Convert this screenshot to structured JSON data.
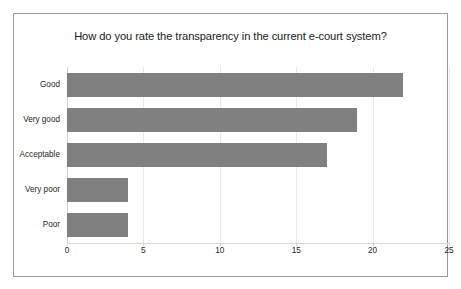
{
  "chart_data": {
    "type": "bar",
    "orientation": "horizontal",
    "title": "How do you rate the transparency in the current e-court system?",
    "categories": [
      "Good",
      "Very good",
      "Acceptable",
      "Very poor",
      "Poor"
    ],
    "values": [
      22,
      19,
      17,
      4,
      4
    ],
    "xlabel": "",
    "ylabel": "",
    "xlim": [
      0,
      25
    ],
    "xticks": [
      0,
      5,
      10,
      15,
      20,
      25
    ],
    "xtick_labels": [
      "0",
      "5",
      "10",
      "15",
      "20",
      "25"
    ],
    "grid": "vertical",
    "legend": "none",
    "series": [
      {
        "name": "Responses",
        "values": [
          22,
          19,
          17,
          4,
          4
        ],
        "color": "#808080"
      }
    ],
    "colors": {
      "bar": "#808080",
      "gridline": "#e9e9e9",
      "axis": "#d6d6d6",
      "border": "#9a9a9a",
      "background": "#ffffff",
      "text": "#262626"
    }
  }
}
